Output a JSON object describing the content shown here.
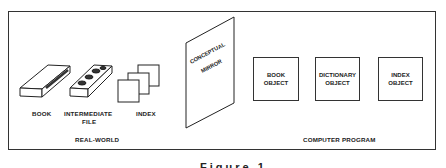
{
  "diagram": {
    "real_world": {
      "group_label": "REAL-WORLD",
      "items": [
        {
          "label": "BOOK",
          "icon": "book-icon"
        },
        {
          "label": "INTERMEDIATE\nFILE",
          "label_line1": "INTERMEDIATE",
          "label_line2": "FILE",
          "icon": "file-box-icon"
        },
        {
          "label": "INDEX",
          "icon": "index-cards-icon"
        }
      ]
    },
    "mirror": {
      "line1": "CONCEPTUAL",
      "line2": "MIRROR"
    },
    "computer_program": {
      "group_label": "COMPUTER PROGRAM",
      "objects": [
        {
          "label": "BOOK\nOBJECT"
        },
        {
          "label": "DICTIONARY\nOBJECT"
        },
        {
          "label": "INDEX\nOBJECT"
        }
      ]
    },
    "caption": "Figure 1"
  }
}
